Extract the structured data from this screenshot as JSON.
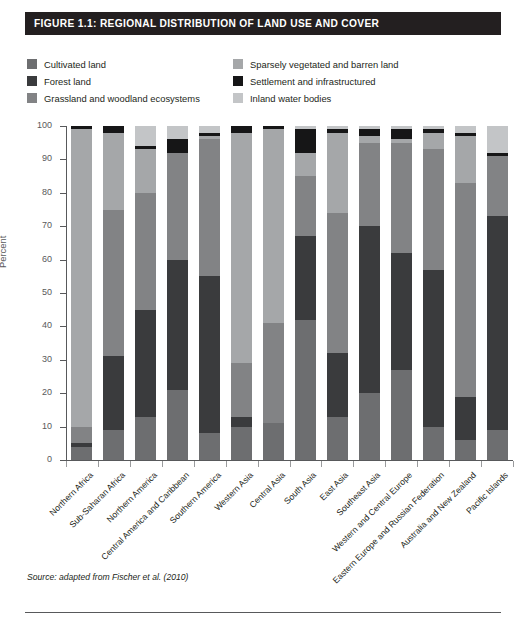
{
  "figure": {
    "title": "FIGURE 1.1: REGIONAL DISTRIBUTION OF LAND USE AND COVER",
    "source": "Source: adapted from Fischer et al. (2010)"
  },
  "legend": {
    "left_items": [
      {
        "label": "Cultivated land",
        "color": "#6d6e70"
      },
      {
        "label": "Forest land",
        "color": "#3a3b3d"
      },
      {
        "label": "Grassland and woodland ecosystems",
        "color": "#828385"
      }
    ],
    "right_items": [
      {
        "label": "Sparsely vegetated and barren land",
        "color": "#a5a7a9"
      },
      {
        "label": "Settlement and infrastructured",
        "color": "#161617"
      },
      {
        "label": "Inland water bodies",
        "color": "#c3c5c7"
      }
    ]
  },
  "chart_data": {
    "type": "bar",
    "stacked": true,
    "title": "FIGURE 1.1: REGIONAL DISTRIBUTION OF LAND USE AND COVER",
    "xlabel": "",
    "ylabel": "Percent",
    "ylim": [
      0,
      100
    ],
    "yticks": [
      0,
      10,
      20,
      30,
      40,
      50,
      60,
      70,
      80,
      90,
      100
    ],
    "grid": false,
    "legend_position": "top",
    "categories": [
      "Northern Africa",
      "Sub-Saharan Africa",
      "Northern America",
      "Central America and Caribbean",
      "Southern America",
      "Western Asia",
      "Central Asia",
      "South Asia",
      "East Asia",
      "Southeast Asia",
      "Western and Central Europe",
      "Eastern Europe and Russian Federation",
      "Australia and New Zealand",
      "Pacific Islands"
    ],
    "series": [
      {
        "name": "Cultivated land",
        "color": "#6d6e70",
        "values": [
          4,
          9,
          13,
          21,
          8,
          10,
          11,
          42,
          13,
          20,
          27,
          10,
          6,
          9
        ]
      },
      {
        "name": "Forest land",
        "color": "#3a3b3d",
        "values": [
          1,
          22,
          32,
          39,
          47,
          3,
          0,
          25,
          19,
          50,
          35,
          47,
          13,
          64
        ]
      },
      {
        "name": "Grassland and woodland ecosystems",
        "color": "#828385",
        "values": [
          5,
          44,
          35,
          32,
          41,
          16,
          30,
          18,
          42,
          25,
          33,
          36,
          64,
          18
        ]
      },
      {
        "name": "Sparsely vegetated and barren land",
        "color": "#a5a7a9",
        "values": [
          89,
          23,
          13,
          0,
          1,
          69,
          58,
          7,
          24,
          2,
          1,
          5,
          14,
          0
        ]
      },
      {
        "name": "Settlement and infrastructured",
        "color": "#161617",
        "values": [
          1,
          2,
          1,
          4,
          1,
          2,
          1,
          7,
          1,
          2,
          3,
          1,
          1,
          1
        ]
      },
      {
        "name": "Inland water bodies",
        "color": "#c3c5c7",
        "values": [
          0,
          0,
          6,
          4,
          2,
          0,
          0,
          1,
          1,
          1,
          1,
          1,
          2,
          8
        ]
      }
    ]
  }
}
